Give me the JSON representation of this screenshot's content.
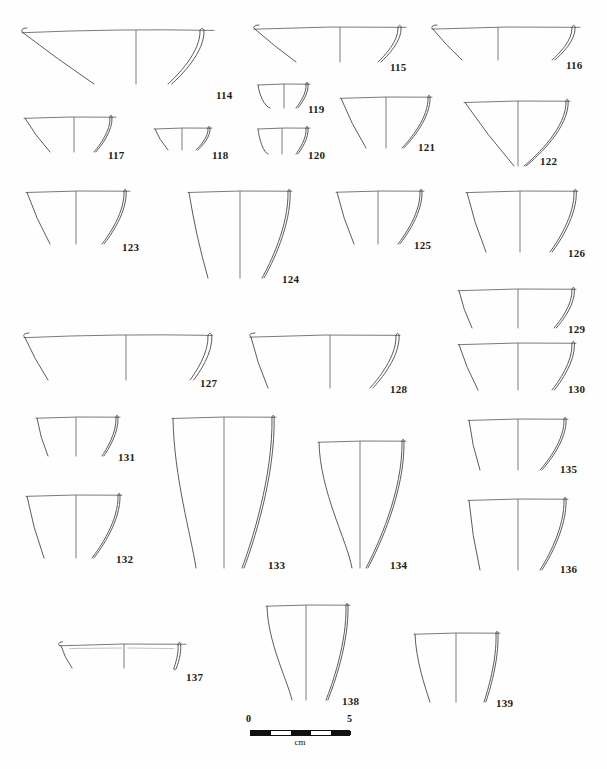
{
  "plate": {
    "kind": "archaeological-pottery-profile-plate",
    "width": 607,
    "height": 769,
    "background_color": "#ffffff",
    "ink_color": "#4a4a4a",
    "label_color": "#1c1c1c",
    "vessel_count": 26,
    "number_range": "114-139"
  },
  "scale": {
    "start_label": "0",
    "end_label": "5",
    "unit_label": "cm",
    "left": 250,
    "top": 722,
    "length_px": 100,
    "segments": 5,
    "bar_color": "#111111"
  },
  "vessels": [
    {
      "id": "114",
      "label": "114",
      "x": 18,
      "y": 24,
      "w": 198,
      "h": 62,
      "rim_left": 4,
      "rim_right": 196,
      "rim_y": 6,
      "axis_x": 118,
      "base_y": 60,
      "form": "shallow-flaring-bowl",
      "left_base_x": 76,
      "sect_top_x": 182,
      "sect_bot_x": 150,
      "label_x": 198,
      "label_y": 66
    },
    {
      "id": "115",
      "label": "115",
      "x": 252,
      "y": 22,
      "w": 156,
      "h": 42,
      "rim_left": 2,
      "rim_right": 154,
      "rim_y": 5,
      "axis_x": 88,
      "base_y": 40,
      "form": "shallow-flaring-bowl",
      "left_base_x": 44,
      "sect_top_x": 146,
      "sect_bot_x": 126,
      "label_x": 138,
      "label_y": 40
    },
    {
      "id": "116",
      "label": "116",
      "x": 430,
      "y": 22,
      "w": 152,
      "h": 40,
      "rim_left": 2,
      "rim_right": 150,
      "rim_y": 5,
      "axis_x": 68,
      "base_y": 38,
      "form": "shallow-flaring-bowl",
      "left_base_x": 32,
      "sect_top_x": 142,
      "sect_bot_x": 122,
      "label_x": 136,
      "label_y": 38
    },
    {
      "id": "117",
      "label": "117",
      "x": 22,
      "y": 112,
      "w": 96,
      "h": 42,
      "rim_left": 2,
      "rim_right": 94,
      "rim_y": 5,
      "axis_x": 52,
      "base_y": 40,
      "form": "shallow-flaring-bowl",
      "left_base_x": 28,
      "sect_top_x": 88,
      "sect_bot_x": 72,
      "label_x": 86,
      "label_y": 38
    },
    {
      "id": "118",
      "label": "118",
      "x": 152,
      "y": 124,
      "w": 62,
      "h": 28,
      "rim_left": 2,
      "rim_right": 60,
      "rim_y": 4,
      "axis_x": 30,
      "base_y": 26,
      "form": "shallow-flaring-bowl",
      "left_base_x": 16,
      "sect_top_x": 56,
      "sect_bot_x": 44,
      "label_x": 60,
      "label_y": 26
    },
    {
      "id": "119",
      "label": "119",
      "x": 256,
      "y": 80,
      "w": 56,
      "h": 32,
      "rim_left": 2,
      "rim_right": 54,
      "rim_y": 4,
      "axis_x": 28,
      "base_y": 28,
      "form": "small-curved-base-bowl",
      "left_base_x": 14,
      "sect_top_x": 50,
      "sect_bot_x": 40,
      "label_x": 52,
      "label_y": 24
    },
    {
      "id": "120",
      "label": "120",
      "x": 256,
      "y": 124,
      "w": 56,
      "h": 34,
      "rim_left": 2,
      "rim_right": 54,
      "rim_y": 4,
      "axis_x": 26,
      "base_y": 30,
      "form": "small-curved-base-bowl",
      "left_base_x": 12,
      "sect_top_x": 50,
      "sect_bot_x": 40,
      "label_x": 52,
      "label_y": 26
    },
    {
      "id": "121",
      "label": "121",
      "x": 338,
      "y": 92,
      "w": 96,
      "h": 58,
      "rim_left": 2,
      "rim_right": 94,
      "rim_y": 5,
      "axis_x": 48,
      "base_y": 56,
      "form": "deep-conical-bowl",
      "left_base_x": 28,
      "sect_top_x": 90,
      "sect_bot_x": 64,
      "label_x": 80,
      "label_y": 50
    },
    {
      "id": "122",
      "label": "122",
      "x": 462,
      "y": 96,
      "w": 110,
      "h": 72,
      "rim_left": 2,
      "rim_right": 108,
      "rim_y": 5,
      "axis_x": 56,
      "base_y": 70,
      "form": "deep-conical-bowl",
      "left_base_x": 52,
      "sect_top_x": 104,
      "sect_bot_x": 62,
      "label_x": 78,
      "label_y": 60
    },
    {
      "id": "123",
      "label": "123",
      "x": 24,
      "y": 186,
      "w": 108,
      "h": 62,
      "rim_left": 2,
      "rim_right": 106,
      "rim_y": 5,
      "axis_x": 52,
      "base_y": 58,
      "form": "deep-flaring-cup",
      "left_base_x": 26,
      "sect_top_x": 100,
      "sect_bot_x": 78,
      "label_x": 98,
      "label_y": 56
    },
    {
      "id": "124",
      "label": "124",
      "x": 186,
      "y": 186,
      "w": 108,
      "h": 96,
      "rim_left": 2,
      "rim_right": 106,
      "rim_y": 5,
      "axis_x": 54,
      "base_y": 92,
      "form": "deep-flaring-cup",
      "left_base_x": 22,
      "sect_top_x": 102,
      "sect_bot_x": 76,
      "label_x": 96,
      "label_y": 88
    },
    {
      "id": "125",
      "label": "125",
      "x": 334,
      "y": 186,
      "w": 92,
      "h": 62,
      "rim_left": 2,
      "rim_right": 90,
      "rim_y": 5,
      "axis_x": 44,
      "base_y": 58,
      "form": "deep-flaring-cup",
      "left_base_x": 20,
      "sect_top_x": 86,
      "sect_bot_x": 64,
      "label_x": 80,
      "label_y": 54
    },
    {
      "id": "126",
      "label": "126",
      "x": 464,
      "y": 186,
      "w": 116,
      "h": 70,
      "rim_left": 2,
      "rim_right": 114,
      "rim_y": 5,
      "axis_x": 56,
      "base_y": 66,
      "form": "deep-flaring-cup",
      "left_base_x": 22,
      "sect_top_x": 110,
      "sect_bot_x": 86,
      "label_x": 104,
      "label_y": 62
    },
    {
      "id": "129",
      "label": "129",
      "x": 456,
      "y": 284,
      "w": 122,
      "h": 48,
      "rim_left": 2,
      "rim_right": 120,
      "rim_y": 5,
      "axis_x": 62,
      "base_y": 44,
      "form": "shallow-flaring-bowl",
      "left_base_x": 16,
      "sect_top_x": 116,
      "sect_bot_x": 98,
      "label_x": 112,
      "label_y": 40
    },
    {
      "id": "130",
      "label": "130",
      "x": 456,
      "y": 338,
      "w": 122,
      "h": 56,
      "rim_left": 2,
      "rim_right": 120,
      "rim_y": 5,
      "axis_x": 62,
      "base_y": 52,
      "form": "shallow-flaring-bowl",
      "left_base_x": 22,
      "sect_top_x": 116,
      "sect_bot_x": 96,
      "label_x": 112,
      "label_y": 46
    },
    {
      "id": "127",
      "label": "127",
      "x": 22,
      "y": 330,
      "w": 192,
      "h": 54,
      "rim_left": 2,
      "rim_right": 190,
      "rim_y": 5,
      "axis_x": 104,
      "base_y": 50,
      "form": "shallow-flaring-bowl",
      "left_base_x": 26,
      "sect_top_x": 186,
      "sect_bot_x": 168,
      "label_x": 178,
      "label_y": 48
    },
    {
      "id": "128",
      "label": "128",
      "x": 248,
      "y": 330,
      "w": 154,
      "h": 62,
      "rim_left": 2,
      "rim_right": 152,
      "rim_y": 5,
      "axis_x": 82,
      "base_y": 58,
      "form": "shallow-flaring-bowl",
      "left_base_x": 20,
      "sect_top_x": 148,
      "sect_bot_x": 122,
      "label_x": 142,
      "label_y": 54
    },
    {
      "id": "131",
      "label": "131",
      "x": 34,
      "y": 412,
      "w": 88,
      "h": 48,
      "rim_left": 2,
      "rim_right": 86,
      "rim_y": 5,
      "axis_x": 42,
      "base_y": 44,
      "form": "deep-flaring-cup",
      "left_base_x": 14,
      "sect_top_x": 82,
      "sect_bot_x": 68,
      "label_x": 84,
      "label_y": 40
    },
    {
      "id": "132",
      "label": "132",
      "x": 24,
      "y": 490,
      "w": 100,
      "h": 72,
      "rim_left": 2,
      "rim_right": 98,
      "rim_y": 5,
      "axis_x": 52,
      "base_y": 68,
      "form": "deep-flaring-cup",
      "left_base_x": 20,
      "sect_top_x": 94,
      "sect_bot_x": 68,
      "label_x": 92,
      "label_y": 64
    },
    {
      "id": "133",
      "label": "133",
      "x": 170,
      "y": 412,
      "w": 108,
      "h": 160,
      "rim_left": 2,
      "rim_right": 106,
      "rim_y": 5,
      "axis_x": 54,
      "base_y": 156,
      "form": "tall-beaker",
      "left_base_x": 26,
      "sect_top_x": 102,
      "sect_bot_x": 72,
      "label_x": 98,
      "label_y": 148
    },
    {
      "id": "134",
      "label": "134",
      "x": 316,
      "y": 436,
      "w": 92,
      "h": 136,
      "rim_left": 2,
      "rim_right": 90,
      "rim_y": 5,
      "axis_x": 44,
      "base_y": 132,
      "form": "tall-conical-beaker",
      "left_base_x": 36,
      "sect_top_x": 86,
      "sect_bot_x": 50,
      "label_x": 74,
      "label_y": 124
    },
    {
      "id": "135",
      "label": "135",
      "x": 466,
      "y": 414,
      "w": 104,
      "h": 60,
      "rim_left": 2,
      "rim_right": 102,
      "rim_y": 5,
      "axis_x": 52,
      "base_y": 56,
      "form": "deep-flaring-cup",
      "left_base_x": 14,
      "sect_top_x": 98,
      "sect_bot_x": 74,
      "label_x": 94,
      "label_y": 50
    },
    {
      "id": "136",
      "label": "136",
      "x": 466,
      "y": 494,
      "w": 104,
      "h": 80,
      "rim_left": 2,
      "rim_right": 102,
      "rim_y": 5,
      "axis_x": 52,
      "base_y": 76,
      "form": "deep-flaring-cup",
      "left_base_x": 14,
      "sect_top_x": 98,
      "sect_bot_x": 74,
      "label_x": 94,
      "label_y": 70
    },
    {
      "id": "137",
      "label": "137",
      "x": 58,
      "y": 638,
      "w": 130,
      "h": 34,
      "rim_left": 2,
      "rim_right": 128,
      "rim_y": 6,
      "axis_x": 66,
      "base_y": 30,
      "form": "flat-rim-dish-with-interior-decoration",
      "left_base_x": 14,
      "sect_top_x": 120,
      "sect_bot_x": 116,
      "label_x": 128,
      "label_y": 34,
      "has_interior_decoration": true
    },
    {
      "id": "138",
      "label": "138",
      "x": 264,
      "y": 600,
      "w": 88,
      "h": 104,
      "rim_left": 2,
      "rim_right": 86,
      "rim_y": 5,
      "axis_x": 42,
      "base_y": 100,
      "form": "tall-flaring-beaker",
      "left_base_x": 28,
      "sect_top_x": 82,
      "sect_bot_x": 62,
      "label_x": 78,
      "label_y": 96
    },
    {
      "id": "139",
      "label": "139",
      "x": 412,
      "y": 628,
      "w": 90,
      "h": 78,
      "rim_left": 2,
      "rim_right": 88,
      "rim_y": 5,
      "axis_x": 44,
      "base_y": 74,
      "form": "tall-flaring-beaker",
      "left_base_x": 18,
      "sect_top_x": 84,
      "sect_bot_x": 72,
      "label_x": 84,
      "label_y": 70
    }
  ]
}
